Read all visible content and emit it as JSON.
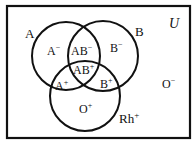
{
  "diagram": {
    "universe_label": "U",
    "sets": [
      {
        "id": "A",
        "label": "A"
      },
      {
        "id": "B",
        "label": "B"
      },
      {
        "id": "Rh",
        "label": "Rh",
        "superscript": "+"
      }
    ],
    "regions": [
      {
        "base": "A",
        "sup": "−"
      },
      {
        "base": "AB",
        "sup": "−"
      },
      {
        "base": "B",
        "sup": "−"
      },
      {
        "base": "AB",
        "sup": "+"
      },
      {
        "base": "A",
        "sup": "+"
      },
      {
        "base": "B",
        "sup": "+"
      },
      {
        "base": "O",
        "sup": "+"
      },
      {
        "base": "O",
        "sup": "−"
      }
    ],
    "colors": {
      "stroke": "#111111",
      "background": "#ffffff"
    }
  }
}
